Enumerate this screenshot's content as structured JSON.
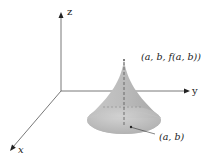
{
  "diagram": {
    "axes": {
      "z_label": "z",
      "y_label": "y",
      "x_label": "x"
    },
    "labels": {
      "apex_point": "(a, b, f(a, b))",
      "base_point": "(a, b)"
    },
    "colors": {
      "axis": "#555555",
      "surface_light": "#d9d9d9",
      "surface_dark": "#a8a8a8",
      "text": "#222222"
    }
  }
}
